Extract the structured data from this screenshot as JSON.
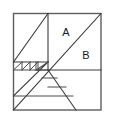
{
  "figure": {
    "name": "subdivided-square-diagram",
    "background_color": "#ffffff",
    "outline_color": "#5d5d5d",
    "line_color": "#3b3b3b",
    "label_color": "#1a1a1a",
    "square": {
      "left": 13,
      "top": 13,
      "right": 101,
      "bottom": 110
    },
    "center_point": {
      "x": 48,
      "y": 62
    },
    "labels": [
      {
        "id": "label-a",
        "text": "A",
        "x": 66,
        "y": 33
      },
      {
        "id": "label-b",
        "text": "B",
        "x": 86,
        "y": 56
      }
    ],
    "lines": [
      {
        "id": "main-diagonal",
        "x1": 101,
        "y1": 13,
        "x2": 13,
        "y2": 110
      },
      {
        "id": "center-vertical",
        "x1": 48,
        "y1": 13,
        "x2": 48,
        "y2": 62
      },
      {
        "id": "center-horizontal-right",
        "x1": 48,
        "y1": 70,
        "x2": 101,
        "y2": 70
      },
      {
        "id": "upper-left-diagonal",
        "x1": 13,
        "y1": 62,
        "x2": 48,
        "y2": 13
      },
      {
        "id": "upper-left-horizontal",
        "x1": 13,
        "y1": 62,
        "x2": 48,
        "y2": 62
      },
      {
        "id": "lower-right-diagonal",
        "x1": 48,
        "y1": 70,
        "x2": 76,
        "y2": 110
      },
      {
        "id": "lower-left-horizontal",
        "x1": 13,
        "y1": 96,
        "x2": 60,
        "y2": 96
      },
      {
        "id": "mid-staircase-diagonal",
        "x1": 13,
        "y1": 96,
        "x2": 48,
        "y2": 62
      },
      {
        "id": "small-staircase-horizontal-1",
        "x1": 35,
        "y1": 70,
        "x2": 48,
        "y2": 70
      },
      {
        "id": "small-staircase-horizontal-2",
        "x1": 40,
        "y1": 78,
        "x2": 56,
        "y2": 78
      },
      {
        "id": "small-staircase-horizontal-3",
        "x1": 46,
        "y1": 86,
        "x2": 66,
        "y2": 86
      },
      {
        "id": "small-staircase-vertical-1",
        "x1": 35,
        "y1": 70,
        "x2": 35,
        "y2": 62
      },
      {
        "id": "riser-1",
        "x1": 22,
        "y1": 62,
        "x2": 22,
        "y2": 70
      },
      {
        "id": "riser-2",
        "x1": 30,
        "y1": 62,
        "x2": 30,
        "y2": 70
      },
      {
        "id": "riser-3",
        "x1": 38,
        "y1": 62,
        "x2": 38,
        "y2": 70
      },
      {
        "id": "band-line",
        "x1": 13,
        "y1": 70,
        "x2": 40,
        "y2": 70
      }
    ]
  }
}
